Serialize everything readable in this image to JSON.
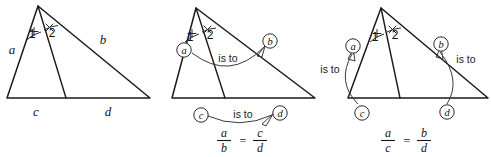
{
  "figure": {
    "background_color": "#ffffff",
    "stroke_color": "#1a1a1a",
    "width": 491,
    "height": 157,
    "panel_count": 3
  },
  "panels": [
    {
      "id": "panel-plain",
      "name": "plain-triangle-with-bisector",
      "caption": "",
      "triangle": {
        "apex": [
          38,
          6
        ],
        "left": [
          7,
          98
        ],
        "right": [
          150,
          98
        ],
        "foot": [
          66,
          98
        ]
      },
      "side_labels": [
        {
          "key": "a",
          "text": "a",
          "x": 12,
          "y": 54
        },
        {
          "key": "b",
          "text": "b",
          "x": 103,
          "y": 44
        },
        {
          "key": "c",
          "text": "c",
          "x": 36,
          "y": 116
        },
        {
          "key": "d",
          "text": "d",
          "x": 108,
          "y": 116
        }
      ],
      "angle_labels": [
        {
          "key": "1",
          "text": "1",
          "x": 32,
          "y": 38
        },
        {
          "key": "2",
          "text": "2",
          "x": 50,
          "y": 37
        }
      ],
      "angle_marks": {
        "left_tick": "plus",
        "right_tick": "cross"
      },
      "relations": [],
      "equation": null
    },
    {
      "id": "panel-ab-cd",
      "name": "triangle-a-over-b-equals-c-over-d",
      "caption": "a/b = c/d",
      "triangle": {
        "apex": [
          196,
          8
        ],
        "left": [
          172,
          98
        ],
        "right": [
          315,
          98
        ],
        "foot": [
          225,
          98
        ]
      },
      "side_labels": [],
      "angle_labels": [
        {
          "key": "1",
          "text": "1",
          "x": 190,
          "y": 40
        },
        {
          "key": "2",
          "text": "2",
          "x": 208,
          "y": 39
        }
      ],
      "angle_marks": {
        "left_tick": "plus",
        "right_tick": "cross"
      },
      "circled_labels": [
        {
          "key": "a",
          "text": "a",
          "cx": 184,
          "cy": 50
        },
        {
          "key": "b",
          "text": "b",
          "cx": 270,
          "cy": 41
        },
        {
          "key": "c",
          "text": "c",
          "cx": 201,
          "cy": 115
        },
        {
          "key": "d",
          "text": "d",
          "cx": 280,
          "cy": 113
        }
      ],
      "relations": [
        {
          "from": "a",
          "to": "b",
          "text": "is to",
          "label_x": 228,
          "label_y": 60
        },
        {
          "from": "c",
          "to": "d",
          "text": "is to",
          "label_x": 243,
          "label_y": 117
        }
      ],
      "equation": {
        "left_num": "a",
        "left_den": "b",
        "operator": "=",
        "right_num": "c",
        "right_den": "d",
        "center_x": 240,
        "center_y": 136
      }
    },
    {
      "id": "panel-ac-bd",
      "name": "triangle-a-over-c-equals-b-over-d",
      "caption": "a/c = b/d",
      "triangle": {
        "apex": [
          381,
          8
        ],
        "left": [
          348,
          98
        ],
        "right": [
          488,
          98
        ],
        "foot": [
          400,
          98
        ]
      },
      "side_labels": [],
      "angle_labels": [
        {
          "key": "1",
          "text": "1",
          "x": 375,
          "y": 40
        },
        {
          "key": "2",
          "text": "2",
          "x": 393,
          "y": 39
        }
      ],
      "angle_marks": {
        "left_tick": "plus",
        "right_tick": "cross"
      },
      "circled_labels": [
        {
          "key": "a",
          "text": "a",
          "cx": 353,
          "cy": 46
        },
        {
          "key": "b",
          "text": "b",
          "cx": 441,
          "cy": 44
        },
        {
          "key": "c",
          "text": "c",
          "cx": 362,
          "cy": 113
        },
        {
          "key": "d",
          "text": "d",
          "cx": 447,
          "cy": 112
        }
      ],
      "relations": [
        {
          "from": "a",
          "to": "c",
          "text": "is to",
          "label_x": 330,
          "label_y": 71
        },
        {
          "from": "b",
          "to": "d",
          "text": "is to",
          "label_x": 464,
          "label_y": 61
        }
      ],
      "equation": {
        "left_num": "a",
        "left_den": "c",
        "operator": "=",
        "right_num": "b",
        "right_den": "d",
        "center_x": 404,
        "center_y": 136
      }
    }
  ]
}
